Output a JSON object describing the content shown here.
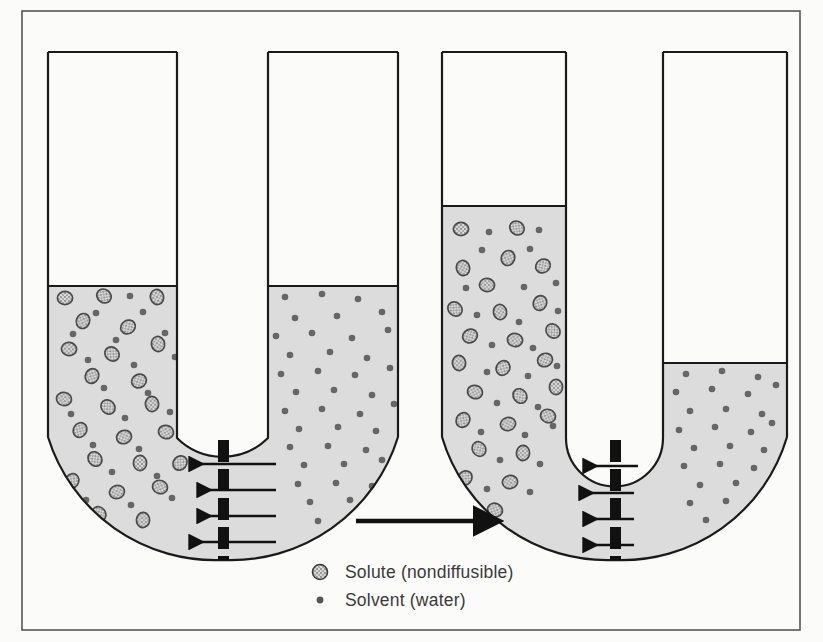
{
  "figure": {
    "frame_color": "#555555",
    "background_color": "#fbfbfa",
    "fluid_color": "#dcdcdc",
    "outline_color": "#1a1a1a",
    "membrane_color": "#111111",
    "solute_fill": "#d2d2d2",
    "solute_stroke": "#4a4a4a",
    "solvent_color": "#666666"
  },
  "legend": {
    "items": [
      {
        "marker": "solute-particle-icon",
        "label": "Solute (nondiffusible)"
      },
      {
        "marker": "solvent-dot-icon",
        "label": "Solvent (water)"
      }
    ]
  },
  "process_arrow": {
    "name": "process-direction-arrow",
    "direction": "right",
    "x1": 356,
    "y1": 521,
    "x2": 476,
    "y2": 521
  },
  "panels": [
    {
      "id": "before",
      "name": "u-tube-before",
      "left_arm": {
        "x1": 48,
        "x2": 177,
        "top": 52,
        "fluid_level": 286
      },
      "right_arm": {
        "x1": 268,
        "x2": 398,
        "top": 52,
        "fluid_level": 286
      },
      "inner_curve_bottom": 438,
      "outer_curve_bottom": 560,
      "membrane": {
        "x": 218,
        "y_top": 440,
        "y_bottom": 560,
        "width": 11
      },
      "membrane_arrows": [
        {
          "y": 464,
          "x_tail": 276,
          "x_head": 190
        },
        {
          "y": 490,
          "x_tail": 276,
          "x_head": 198
        },
        {
          "y": 516,
          "x_tail": 276,
          "x_head": 198
        },
        {
          "y": 542,
          "x_tail": 276,
          "x_head": 190
        }
      ],
      "solute_count": 24,
      "solvent_left_count": 22,
      "solvent_right_count": 40
    },
    {
      "id": "after",
      "name": "u-tube-after",
      "left_arm": {
        "x1": 442,
        "x2": 566,
        "top": 52,
        "fluid_level": 206
      },
      "right_arm": {
        "x1": 663,
        "x2": 787,
        "top": 52,
        "fluid_level": 363
      },
      "inner_curve_bottom": 438,
      "outer_curve_bottom": 560,
      "membrane": {
        "x": 610,
        "y_top": 440,
        "y_bottom": 560,
        "width": 11
      },
      "membrane_arrows": [
        {
          "y": 466,
          "x_tail": 638,
          "x_head": 584
        },
        {
          "y": 493,
          "x_tail": 634,
          "x_head": 580
        },
        {
          "y": 519,
          "x_tail": 634,
          "x_head": 584
        },
        {
          "y": 545,
          "x_tail": 634,
          "x_head": 584
        }
      ],
      "solute_count": 26,
      "solvent_left_count": 24,
      "solvent_right_count": 26
    }
  ],
  "particles": {
    "before": {
      "solute": [
        [
          65,
          298
        ],
        [
          104,
          296
        ],
        [
          157,
          297
        ],
        [
          83,
          321
        ],
        [
          128,
          327
        ],
        [
          69,
          349
        ],
        [
          112,
          354
        ],
        [
          158,
          344
        ],
        [
          92,
          376
        ],
        [
          139,
          381
        ],
        [
          64,
          399
        ],
        [
          108,
          407
        ],
        [
          152,
          404
        ],
        [
          80,
          430
        ],
        [
          124,
          437
        ],
        [
          166,
          432
        ],
        [
          95,
          459
        ],
        [
          140,
          463
        ],
        [
          72,
          481
        ],
        [
          117,
          492
        ],
        [
          160,
          487
        ],
        [
          99,
          514
        ],
        [
          143,
          520
        ],
        [
          180,
          463
        ]
      ],
      "solvent_left": [
        [
          130,
          296
        ],
        [
          96,
          313
        ],
        [
          143,
          312
        ],
        [
          73,
          334
        ],
        [
          116,
          340
        ],
        [
          165,
          333
        ],
        [
          88,
          360
        ],
        [
          134,
          365
        ],
        [
          175,
          357
        ],
        [
          104,
          388
        ],
        [
          148,
          393
        ],
        [
          71,
          414
        ],
        [
          125,
          418
        ],
        [
          170,
          412
        ],
        [
          93,
          445
        ],
        [
          139,
          449
        ],
        [
          112,
          472
        ],
        [
          157,
          476
        ],
        [
          86,
          500
        ],
        [
          131,
          505
        ],
        [
          172,
          498
        ],
        [
          110,
          530
        ]
      ],
      "solvent_right": [
        [
          285,
          297
        ],
        [
          322,
          294
        ],
        [
          358,
          299
        ],
        [
          382,
          312
        ],
        [
          295,
          318
        ],
        [
          337,
          316
        ],
        [
          276,
          336
        ],
        [
          312,
          333
        ],
        [
          352,
          338
        ],
        [
          388,
          330
        ],
        [
          290,
          355
        ],
        [
          330,
          352
        ],
        [
          367,
          358
        ],
        [
          281,
          374
        ],
        [
          318,
          371
        ],
        [
          355,
          375
        ],
        [
          390,
          368
        ],
        [
          296,
          392
        ],
        [
          334,
          390
        ],
        [
          372,
          395
        ],
        [
          285,
          411
        ],
        [
          322,
          409
        ],
        [
          360,
          414
        ],
        [
          394,
          404
        ],
        [
          299,
          429
        ],
        [
          338,
          427
        ],
        [
          376,
          431
        ],
        [
          290,
          447
        ],
        [
          328,
          446
        ],
        [
          366,
          450
        ],
        [
          304,
          465
        ],
        [
          344,
          464
        ],
        [
          382,
          460
        ],
        [
          298,
          484
        ],
        [
          336,
          483
        ],
        [
          372,
          486
        ],
        [
          310,
          502
        ],
        [
          350,
          500
        ],
        [
          318,
          521
        ],
        [
          356,
          519
        ]
      ]
    },
    "after": {
      "solute": [
        [
          461,
          229
        ],
        [
          517,
          228
        ],
        [
          463,
          268
        ],
        [
          508,
          258
        ],
        [
          543,
          266
        ],
        [
          487,
          285
        ],
        [
          455,
          309
        ],
        [
          500,
          312
        ],
        [
          540,
          303
        ],
        [
          470,
          336
        ],
        [
          515,
          340
        ],
        [
          553,
          331
        ],
        [
          459,
          363
        ],
        [
          503,
          368
        ],
        [
          545,
          360
        ],
        [
          475,
          392
        ],
        [
          520,
          396
        ],
        [
          556,
          387
        ],
        [
          463,
          420
        ],
        [
          508,
          424
        ],
        [
          548,
          416
        ],
        [
          479,
          449
        ],
        [
          523,
          453
        ],
        [
          465,
          478
        ],
        [
          510,
          482
        ],
        [
          495,
          510
        ]
      ],
      "solvent_left": [
        [
          489,
          232
        ],
        [
          539,
          230
        ],
        [
          482,
          250
        ],
        [
          530,
          249
        ],
        [
          466,
          288
        ],
        [
          524,
          287
        ],
        [
          556,
          283
        ],
        [
          477,
          315
        ],
        [
          519,
          322
        ],
        [
          558,
          311
        ],
        [
          492,
          345
        ],
        [
          533,
          348
        ],
        [
          487,
          372
        ],
        [
          528,
          376
        ],
        [
          557,
          366
        ],
        [
          497,
          403
        ],
        [
          538,
          407
        ],
        [
          481,
          432
        ],
        [
          525,
          435
        ],
        [
          553,
          426
        ],
        [
          500,
          460
        ],
        [
          540,
          464
        ],
        [
          487,
          489
        ],
        [
          530,
          492
        ]
      ],
      "solvent_right": [
        [
          686,
          374
        ],
        [
          722,
          371
        ],
        [
          758,
          377
        ],
        [
          676,
          392
        ],
        [
          712,
          389
        ],
        [
          748,
          394
        ],
        [
          776,
          385
        ],
        [
          690,
          411
        ],
        [
          726,
          409
        ],
        [
          762,
          414
        ],
        [
          679,
          430
        ],
        [
          715,
          427
        ],
        [
          751,
          432
        ],
        [
          772,
          423
        ],
        [
          694,
          448
        ],
        [
          730,
          446
        ],
        [
          764,
          450
        ],
        [
          684,
          466
        ],
        [
          720,
          464
        ],
        [
          754,
          468
        ],
        [
          700,
          485
        ],
        [
          736,
          483
        ],
        [
          690,
          503
        ],
        [
          726,
          501
        ],
        [
          706,
          520
        ],
        [
          742,
          518
        ]
      ]
    }
  }
}
